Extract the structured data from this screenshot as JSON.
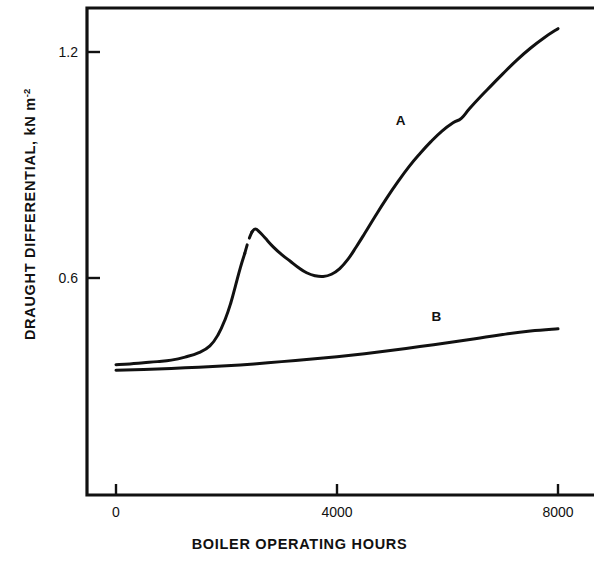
{
  "chart_data": {
    "type": "line",
    "title": "",
    "xlabel": "BOILER OPERATING HOURS",
    "ylabel": "DRAUGHT DIFFERENTIAL, kN m",
    "ylabel_exponent": "-2",
    "xlim": [
      -170,
      8700
    ],
    "ylim": [
      0.0,
      1.3
    ],
    "grid": false,
    "legend": "inline-curve-labels",
    "xticks": [
      {
        "value": 0,
        "label": "0"
      },
      {
        "value": 4000,
        "label": "4000"
      },
      {
        "value": 8000,
        "label": "8000"
      }
    ],
    "yticks": [
      {
        "value": 0.6,
        "label": "0.6"
      },
      {
        "value": 1.2,
        "label": "1.2"
      }
    ],
    "series": [
      {
        "name": "A",
        "label": "A",
        "label_x": 5150,
        "label_y": 1.02,
        "style": "solid-with-dashed-gap",
        "points": [
          [
            0,
            0.37
          ],
          [
            250,
            0.372
          ],
          [
            500,
            0.375
          ],
          [
            750,
            0.378
          ],
          [
            1000,
            0.382
          ],
          [
            1250,
            0.39
          ],
          [
            1500,
            0.402
          ],
          [
            1700,
            0.42
          ],
          [
            1850,
            0.45
          ],
          [
            1980,
            0.492
          ],
          [
            2080,
            0.535
          ],
          [
            2160,
            0.578
          ],
          [
            2250,
            0.627
          ],
          [
            2330,
            0.665
          ]
        ],
        "dashed_points": [
          [
            2330,
            0.665
          ],
          [
            2400,
            0.7
          ],
          [
            2460,
            0.722
          ]
        ],
        "points_after_gap": [
          [
            2460,
            0.722
          ],
          [
            2520,
            0.73
          ],
          [
            2600,
            0.722
          ],
          [
            2700,
            0.706
          ],
          [
            2850,
            0.682
          ],
          [
            3000,
            0.662
          ],
          [
            3150,
            0.645
          ],
          [
            3300,
            0.628
          ],
          [
            3450,
            0.614
          ],
          [
            3600,
            0.606
          ],
          [
            3750,
            0.604
          ],
          [
            3900,
            0.61
          ],
          [
            4050,
            0.625
          ],
          [
            4200,
            0.65
          ],
          [
            4350,
            0.683
          ],
          [
            4500,
            0.718
          ],
          [
            4700,
            0.766
          ],
          [
            4900,
            0.812
          ],
          [
            5100,
            0.855
          ],
          [
            5300,
            0.895
          ],
          [
            5500,
            0.93
          ],
          [
            5700,
            0.962
          ],
          [
            5900,
            0.99
          ],
          [
            6100,
            1.012
          ],
          [
            6250,
            1.024
          ],
          [
            6400,
            1.05
          ],
          [
            6600,
            1.082
          ],
          [
            6800,
            1.112
          ],
          [
            7000,
            1.142
          ],
          [
            7250,
            1.178
          ],
          [
            7500,
            1.21
          ],
          [
            7750,
            1.238
          ],
          [
            8000,
            1.262
          ]
        ]
      },
      {
        "name": "B",
        "label": "B",
        "label_x": 5800,
        "label_y": 0.5,
        "style": "solid",
        "points": [
          [
            0,
            0.355
          ],
          [
            500,
            0.357
          ],
          [
            1000,
            0.36
          ],
          [
            1500,
            0.363
          ],
          [
            2000,
            0.367
          ],
          [
            2500,
            0.372
          ],
          [
            3000,
            0.378
          ],
          [
            3500,
            0.384
          ],
          [
            4000,
            0.391
          ],
          [
            4500,
            0.399
          ],
          [
            5000,
            0.408
          ],
          [
            5500,
            0.418
          ],
          [
            6000,
            0.428
          ],
          [
            6500,
            0.439
          ],
          [
            7000,
            0.45
          ],
          [
            7500,
            0.459
          ],
          [
            8000,
            0.465
          ]
        ]
      }
    ]
  },
  "colors": {
    "ink": "#111111",
    "background": "#ffffff"
  }
}
